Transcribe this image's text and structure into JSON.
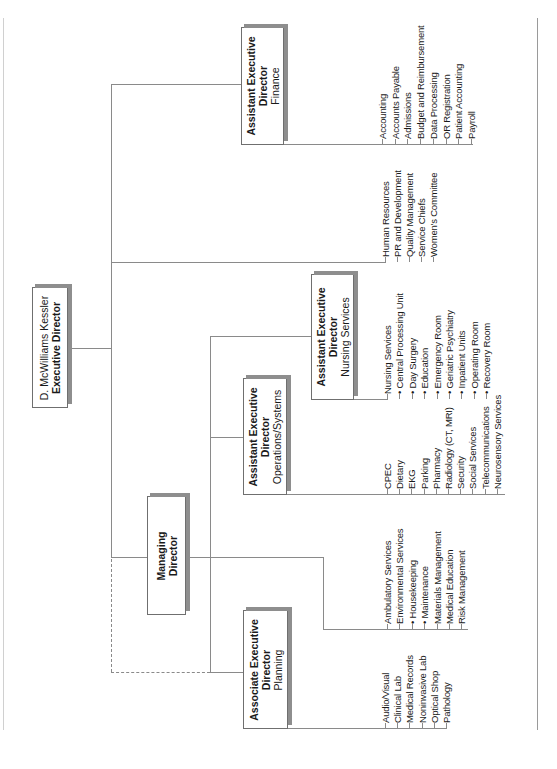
{
  "chart": {
    "orientation": "rotated-90-ccw",
    "colors": {
      "line": "#8a8a8a",
      "box_border": "#6f6f6f",
      "box_shadow": "#8e8e8e",
      "text": "#1a1a1a"
    }
  },
  "executive": {
    "name": "D. McWilliams Kessler",
    "title": "Executive Director"
  },
  "managing": {
    "title_line1": "Managing",
    "title_line2": "Director"
  },
  "finance": {
    "title_line1": "Assistant Executive",
    "title_line2": "Director",
    "dept": "Finance",
    "items": [
      "Accounting",
      "Accounts Payable",
      "Admissions",
      "Budget and Reimbursement",
      "Data Processing",
      "OR Registration",
      "Patient Accounting",
      "Payroll"
    ]
  },
  "staff": {
    "items": [
      "Human Resources",
      "PR and Development",
      "Quality Management",
      "Service Chiefs",
      "Women's Committee"
    ]
  },
  "nursing": {
    "title_line1": "Assistant Executive",
    "title_line2": "Director",
    "dept": "Nursing Services",
    "items": [
      "Nursing Services",
      "• Central Processing Unit",
      "• Day Surgery",
      "• Education",
      "• Emergency Room",
      "• Geriatric Psychiatry",
      "• Inpatient Units",
      "• Operating Room",
      "• Recovery Room"
    ]
  },
  "operations": {
    "title_line1": "Assistant Executive",
    "title_line2": "Director",
    "dept": "Operations/Systems",
    "items": [
      "CPEC",
      "Dietary",
      "EKG",
      "Parking",
      "Pharmacy",
      "Radiology (CT, MRI)",
      "Security",
      "Social Services",
      "Telecommunications",
      "Neurosensory Services"
    ]
  },
  "managing_list": {
    "items": [
      "Ambulatory Services",
      "Environmental Services",
      "• Housekeeping",
      "• Maintenance",
      "Materials Management",
      "Medical Education",
      "Risk Management"
    ]
  },
  "planning": {
    "title_line1": "Associate Executive",
    "title_line2": "Director",
    "dept": "Planning",
    "items": [
      "Audio/Visual",
      "Clinical Lab",
      "Medical Records",
      "Noninvasive Lab",
      "Optical Shop",
      "Pathology"
    ]
  }
}
